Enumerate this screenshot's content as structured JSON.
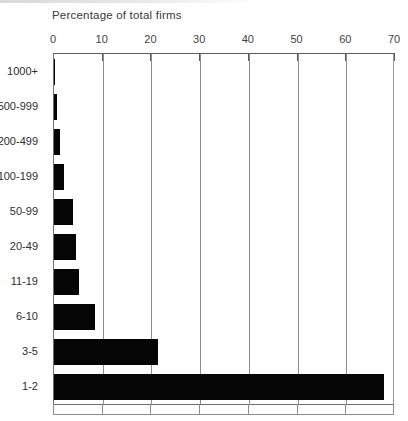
{
  "chart_data": {
    "type": "bar",
    "orientation": "horizontal",
    "title": "Percentage of total firms",
    "xlabel": "Percentage of total firms",
    "ylabel": "",
    "categories": [
      "1000+",
      "500-999",
      "200-499",
      "100-199",
      "50-99",
      "20-49",
      "11-19",
      "6-10",
      "3-5",
      "1-2"
    ],
    "values": [
      0.1,
      0.6,
      1.3,
      2.1,
      4.0,
      4.6,
      5.2,
      8.4,
      21.3,
      67.8
    ],
    "xlim": [
      0,
      70
    ],
    "xticks": [
      0,
      10,
      20,
      30,
      40,
      50,
      60,
      70
    ],
    "xticklabels": [
      "0",
      "10",
      "20",
      "30",
      "40",
      "50",
      "60",
      "70"
    ],
    "grid": true,
    "grid_axis": "x",
    "legend": false,
    "bar_color": "#050505",
    "axis_color": "#5d5d5d",
    "background": "#ffffff"
  },
  "figure": {
    "title": "Percentage of total firms",
    "caption": "",
    "axis_position": "top"
  }
}
